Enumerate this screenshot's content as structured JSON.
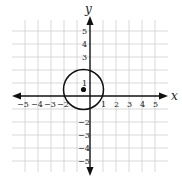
{
  "diagram": {
    "type": "coordinate-plane",
    "x_axis_label": "x",
    "y_axis_label": "y",
    "x_range": [
      -5,
      5
    ],
    "y_range": [
      -5,
      5
    ],
    "x_tick_labels": [
      "−5",
      "−4",
      "−3",
      "−2",
      "1",
      "2",
      "3",
      "4",
      "5"
    ],
    "y_tick_labels": [
      "5",
      "4",
      "3",
      "1",
      "−2",
      "−3",
      "−4",
      "−5"
    ],
    "circle": {
      "center": [
        -0.5,
        0.5
      ],
      "radius": 1.5
    },
    "point": {
      "x": -0.5,
      "y": 0.5
    },
    "colors": {
      "grid": "#cfcfcf",
      "axes": "#111111",
      "circle": "#111111",
      "point": "#111111"
    }
  }
}
